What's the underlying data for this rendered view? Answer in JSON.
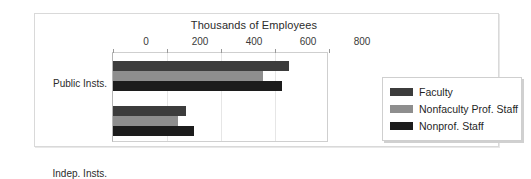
{
  "chart_data": {
    "type": "bar",
    "orientation": "horizontal",
    "title": "Thousands of Employees",
    "xlabel": "",
    "ylabel": "",
    "categories": [
      "Public Insts.",
      "Indep. Insts."
    ],
    "series": [
      {
        "name": "Faculty",
        "color": "#3c3c3c",
        "values": [
          650,
          270
        ]
      },
      {
        "name": "Nonfaculty Prof. Staff",
        "color": "#8e8e8e",
        "values": [
          555,
          240
        ]
      },
      {
        "name": "Nonprof. Staff",
        "color": "#1c1c1c",
        "values": [
          625,
          300
        ]
      }
    ],
    "xlim": [
      0,
      800
    ],
    "xticks": [
      0,
      200,
      400,
      600,
      800
    ],
    "xtick_labels": [
      "0",
      "200",
      "400",
      "600",
      "800"
    ],
    "grid": true,
    "legend_position": "right"
  }
}
